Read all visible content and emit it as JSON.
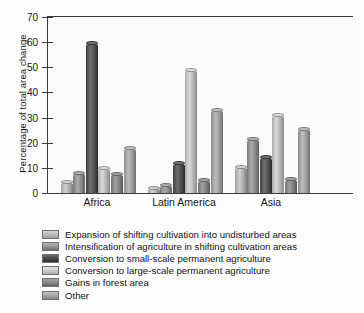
{
  "chart_data": {
    "type": "bar",
    "title": "",
    "xlabel": "",
    "ylabel": "Percentage of total area change",
    "ylim": [
      0,
      70
    ],
    "yticks": [
      0,
      10,
      20,
      30,
      40,
      50,
      60,
      70
    ],
    "grid": false,
    "legend_position": "below",
    "categories": [
      "Africa",
      "Latin America",
      "Asia"
    ],
    "series": [
      {
        "name": "Expansion of shifting cultivation into undisturbed areas",
        "color": "#bdbdbd",
        "values": [
          4.5,
          2.0,
          10.5
        ]
      },
      {
        "name": "Intensification of agriculture in shifting cultivation areas",
        "color": "#9a9a9a",
        "values": [
          8.0,
          3.0,
          21.5
        ]
      },
      {
        "name": "Conversion to small-scale permanent agriculture",
        "color": "#4a4a4a",
        "values": [
          59.5,
          12.0,
          14.5
        ]
      },
      {
        "name": "Conversion to large-scale permanent agriculture",
        "color": "#cfcfcf",
        "values": [
          10.0,
          49.0,
          31.0
        ]
      },
      {
        "name": "Gains in forest area",
        "color": "#8c8c8c",
        "values": [
          7.5,
          5.0,
          5.5
        ]
      },
      {
        "name": "Other",
        "color": "#aaaaaa",
        "values": [
          18.0,
          33.0,
          25.5
        ]
      }
    ]
  },
  "axis": {
    "y_title": "Percentage of total area change",
    "y_tick_labels": [
      "0",
      "10",
      "20",
      "30",
      "40",
      "50",
      "60",
      "70"
    ],
    "x_tick_labels": [
      "Africa",
      "Latin America",
      "Asia"
    ]
  },
  "legend": {
    "items": [
      {
        "label": "Expansion of shifting cultivation into undisturbed areas"
      },
      {
        "label": "Intensification of agriculture in shifting cultivation areas"
      },
      {
        "label": "Conversion to small-scale permanent agriculture"
      },
      {
        "label": "Conversion to large-scale permanent agriculture"
      },
      {
        "label": "Gains in forest area"
      },
      {
        "label": "Other"
      }
    ]
  }
}
